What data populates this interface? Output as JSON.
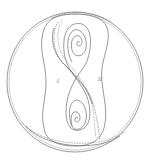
{
  "figure": {
    "type": "phase-portrait",
    "stroke_color": "#555555",
    "background": "#ffffff",
    "labels": {
      "left": "I",
      "right": "II",
      "upper_focus": "G",
      "lower_focus": "G"
    }
  }
}
